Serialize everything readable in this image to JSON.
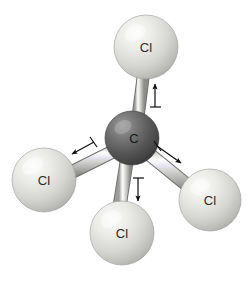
{
  "figure": {
    "name": "carbon-tetrachloride-ball-and-stick-model",
    "background_color": "#ffffff",
    "width": 250,
    "height": 286
  },
  "atoms": [
    {
      "id": "cl-top",
      "label": "Cl",
      "element": "Cl",
      "cx": 146,
      "cy": 47,
      "r": 32,
      "color": "#d9dad6",
      "highlight_color": "#f3f3f1",
      "shadow_color": "#a9aaa6",
      "label_x": 146,
      "label_y": 49,
      "label_color": "#2b2b2b"
    },
    {
      "id": "cl-left",
      "label": "Cl",
      "element": "Cl",
      "cx": 44,
      "cy": 180,
      "r": 32,
      "color": "#d9dad6",
      "highlight_color": "#f3f3f1",
      "shadow_color": "#a9aaa6",
      "label_x": 44,
      "label_y": 182,
      "label_color": "#2b2b2b"
    },
    {
      "id": "cl-bottom",
      "label": "Cl",
      "element": "Cl",
      "cx": 122,
      "cy": 233,
      "r": 32,
      "color": "#d9dad6",
      "highlight_color": "#f3f3f1",
      "shadow_color": "#a9aaa6",
      "label_x": 122,
      "label_y": 235,
      "label_color": "#2b2b2b"
    },
    {
      "id": "cl-right",
      "label": "Cl",
      "element": "Cl",
      "cx": 210,
      "cy": 200,
      "r": 31,
      "color": "#d9dad6",
      "highlight_color": "#f3f3f1",
      "shadow_color": "#a9aaa6",
      "label_x": 210,
      "label_y": 202,
      "label_color": "#2b2b2b"
    },
    {
      "id": "carbon-center",
      "label": "C",
      "element": "C",
      "cx": 132,
      "cy": 138,
      "r": 27,
      "color": "#5a5a5a",
      "highlight_color": "#8f8f8f",
      "shadow_color": "#343434",
      "label_x": 134,
      "label_y": 140,
      "label_color": "#161616"
    }
  ],
  "bonds": [
    {
      "id": "bond-c-cl-top",
      "from": "carbon-center",
      "to": "cl-top",
      "x1": 135,
      "y1": 138,
      "x2": 144,
      "y2": 73,
      "width": 11
    },
    {
      "id": "bond-c-cl-left",
      "from": "carbon-center",
      "to": "cl-left",
      "x1": 132,
      "y1": 142,
      "x2": 70,
      "y2": 173,
      "width": 12
    },
    {
      "id": "bond-c-cl-bottom",
      "from": "carbon-center",
      "to": "cl-bottom",
      "x1": 130,
      "y1": 142,
      "x2": 119,
      "y2": 206,
      "width": 12
    },
    {
      "id": "bond-c-cl-right",
      "from": "carbon-center",
      "to": "cl-right",
      "x1": 140,
      "y1": 146,
      "x2": 188,
      "y2": 185,
      "width": 12
    }
  ],
  "vibration_arrows": [
    {
      "id": "arrow-top-up",
      "direction": "up",
      "tail_x": 155,
      "tail_y": 107,
      "head_x": 155,
      "head_y": 79,
      "tick_x1": 150,
      "tick_y1": 107,
      "tick_x2": 160,
      "tick_y2": 107,
      "color": "#0d0d0d"
    },
    {
      "id": "arrow-left-outward",
      "direction": "down-left",
      "tail_x": 93,
      "tail_y": 143,
      "head_x": 68,
      "head_y": 156,
      "tick_x1": 90,
      "tick_y1": 138,
      "tick_x2": 96,
      "tick_y2": 147,
      "color": "#0d0d0d"
    },
    {
      "id": "arrow-bottom-down",
      "direction": "down",
      "tail_x": 138,
      "tail_y": 178,
      "head_x": 138,
      "head_y": 206,
      "tick_x1": 133,
      "tick_y1": 178,
      "tick_x2": 143,
      "tick_y2": 178,
      "color": "#0d0d0d"
    },
    {
      "id": "arrow-right-outward",
      "direction": "down-right",
      "tail_x": 158,
      "tail_y": 146,
      "head_x": 185,
      "head_y": 166,
      "tick_x1": 155,
      "tick_y1": 142,
      "tick_x2": 161,
      "tick_y2": 151,
      "color": "#0d0d0d"
    }
  ]
}
